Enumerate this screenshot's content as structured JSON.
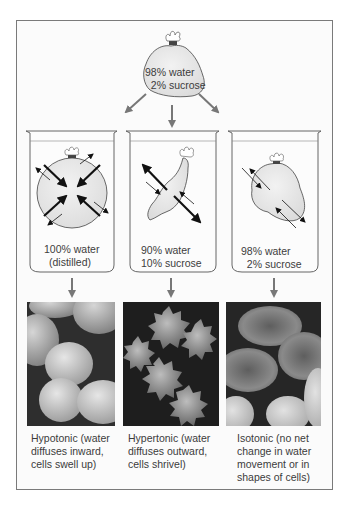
{
  "figure": {
    "top_bag": {
      "line1": "98% water",
      "line2": "  2% sucrose"
    },
    "beakers": [
      {
        "id": "hypotonic",
        "line1": "100% water",
        "line2": "(distilled)"
      },
      {
        "id": "hypertonic",
        "line1": "90% water",
        "line2": "10% sucrose"
      },
      {
        "id": "isotonic",
        "line1": "98% water",
        "line2": "  2% sucrose"
      }
    ],
    "captions": [
      {
        "id": "hypotonic",
        "text": "Hypotonic (water\ndiffuses inward,\ncells swell up)"
      },
      {
        "id": "hypertonic",
        "text": "Hypertonic (water\ndiffuses outward,\ncells shrivel)"
      },
      {
        "id": "isotonic",
        "text": "Isotonic (no net\nchange in water\nmovement or in\nshapes of cells)"
      }
    ],
    "photos": [
      {
        "id": "swollen-cells",
        "subject": "swollen red blood cells"
      },
      {
        "id": "shriveled-cells",
        "subject": "crenated red blood cells"
      },
      {
        "id": "normal-cells",
        "subject": "normal biconcave red blood cells"
      }
    ],
    "colors": {
      "frame": "#7a7a7a",
      "arrow_gray": "#777777",
      "bag_fill": "#e6e6e6",
      "ink": "#1a1a1a",
      "text": "#3c3c3c"
    }
  }
}
